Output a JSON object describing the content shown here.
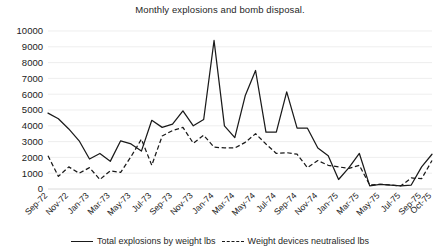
{
  "chart_data": {
    "type": "line",
    "title": "Monthly explosions and bomb disposal.",
    "xlabel": "",
    "ylabel": "",
    "ylim": [
      0,
      10000
    ],
    "ytick_labels": [
      "10000",
      "9000",
      "8000",
      "7000",
      "6000",
      "5000",
      "4000",
      "3000",
      "2000",
      "1000",
      "0"
    ],
    "yticks": [
      10000,
      9000,
      8000,
      7000,
      6000,
      5000,
      4000,
      3000,
      2000,
      1000,
      0
    ],
    "grid": true,
    "legend_position": "bottom",
    "x": [
      "Sep-72",
      "Oct-72",
      "Nov-72",
      "Dec-72",
      "Jan-73",
      "Feb-73",
      "Mar-73",
      "Apr-73",
      "May-73",
      "Jun-73",
      "Jul-73",
      "Aug-73",
      "Sep-73",
      "Oct-73",
      "Nov-73",
      "Dec-73",
      "Jan-74",
      "Feb-74",
      "Mar-74",
      "Apr-74",
      "May-74",
      "Jun-74",
      "Jul-74",
      "Aug-74",
      "Sep-74",
      "Oct-74",
      "Nov-74",
      "Dec-74",
      "Jan-75",
      "Feb-75",
      "Mar-75",
      "Apr-75",
      "May-75",
      "Jun-75",
      "Jul-75",
      "Aug-75",
      "Sep-75",
      "Oct-75"
    ],
    "xtick_labels": [
      "Sep-72",
      "Nov-72",
      "Jan-73",
      "Mar-73",
      "May-73",
      "Jul-73",
      "Sep-73",
      "Nov-73",
      "Jan-74",
      "Mar-74",
      "May-74",
      "Jul-74",
      "Sep-74",
      "Nov-74",
      "Jan-75",
      "Mar-75",
      "May-75",
      "Jul-75",
      "Sep-75",
      "Oct-75"
    ],
    "series": [
      {
        "name": "Total explosions by weight lbs",
        "style": "solid",
        "color": "#1a1a1a",
        "values": [
          4800,
          4450,
          3800,
          3050,
          1900,
          2250,
          1750,
          3050,
          2850,
          2400,
          4350,
          3900,
          4100,
          4950,
          4000,
          4400,
          9400,
          4000,
          3250,
          5900,
          7500,
          3600,
          3600,
          6150,
          3850,
          3850,
          2600,
          2100,
          600,
          1350,
          2250,
          200,
          300,
          250,
          200,
          250,
          1400,
          2200
        ]
      },
      {
        "name": "Weight devices neutralised lbs",
        "style": "dashed",
        "color": "#1a1a1a",
        "values": [
          2100,
          800,
          1400,
          1000,
          1350,
          600,
          1150,
          1050,
          2050,
          3150,
          1500,
          3350,
          3700,
          3900,
          2900,
          3400,
          2650,
          2600,
          2600,
          2950,
          3500,
          2850,
          2250,
          2300,
          2200,
          1350,
          1800,
          1500,
          1400,
          1300,
          1500,
          250,
          300,
          250,
          200,
          700,
          650,
          1800
        ]
      }
    ]
  },
  "legend": {
    "items": [
      {
        "label": "Total explosions by weight lbs",
        "style": "solid"
      },
      {
        "label": "Weight devices neutralised lbs",
        "style": "dashed"
      }
    ]
  }
}
